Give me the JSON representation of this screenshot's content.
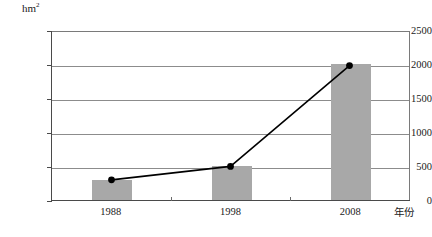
{
  "chart_data": {
    "type": "bar",
    "title": "",
    "subtitle": "",
    "xlabel": "年份",
    "ylabel": "hm²",
    "ylabel_unit_base": "hm",
    "ylabel_unit_exp": "2",
    "categories": [
      "1988",
      "1998",
      "2008"
    ],
    "values": [
      300,
      500,
      2000
    ],
    "series": [
      {
        "name": "面积",
        "type": "bar",
        "values": [
          300,
          500,
          2000
        ]
      },
      {
        "name": "趋势",
        "type": "line",
        "values": [
          300,
          500,
          2000
        ]
      }
    ],
    "ylim": [
      0,
      2500
    ],
    "yticks": [
      0,
      500,
      1000,
      1500,
      2000,
      2500
    ],
    "ytick_labels": [
      "0",
      "500",
      "1000",
      "1500",
      "2000",
      "2500"
    ],
    "grid": true,
    "grid_axis": "y",
    "legend": false,
    "legend_position": "none",
    "annotations": [],
    "colors": {
      "bar_fill": "#a8a8a8",
      "line": "#000000",
      "marker": "#000000",
      "gridline": "#8c8c8c",
      "frame": "#7a7a7a",
      "axis": "#4a4a4a",
      "background": "#ffffff",
      "text": "#1a1a1a"
    }
  }
}
